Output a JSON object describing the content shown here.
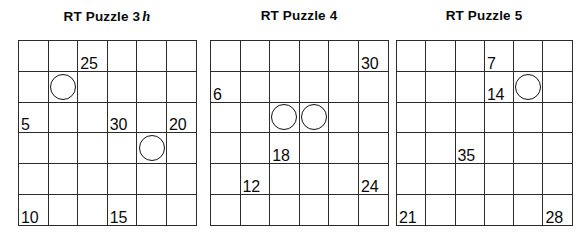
{
  "sheet": {
    "background_color": "#ffffff",
    "grid_line_color": "#2b2b2b",
    "text_color": "#0a0a0a"
  },
  "puzzles": [
    {
      "id": "puzzle-3",
      "title_main": "RT Puzzle 3",
      "title_hint": "h",
      "left": 18,
      "width": 178,
      "rows": 6,
      "cols": 6,
      "cell_w": 29.6,
      "cell_h": 30.8,
      "cells": [
        [
          {
            "value": "",
            "circle": false
          },
          {
            "value": "",
            "circle": false
          },
          {
            "value": "25",
            "circle": false
          },
          {
            "value": "",
            "circle": false
          },
          {
            "value": "",
            "circle": false
          },
          {
            "value": "",
            "circle": false
          }
        ],
        [
          {
            "value": "",
            "circle": false
          },
          {
            "value": "",
            "circle": true
          },
          {
            "value": "",
            "circle": false
          },
          {
            "value": "",
            "circle": false
          },
          {
            "value": "",
            "circle": false
          },
          {
            "value": "",
            "circle": false
          }
        ],
        [
          {
            "value": "5",
            "circle": false
          },
          {
            "value": "",
            "circle": false
          },
          {
            "value": "",
            "circle": false
          },
          {
            "value": "30",
            "circle": false
          },
          {
            "value": "",
            "circle": false
          },
          {
            "value": "20",
            "circle": false
          }
        ],
        [
          {
            "value": "",
            "circle": false
          },
          {
            "value": "",
            "circle": false
          },
          {
            "value": "",
            "circle": false
          },
          {
            "value": "",
            "circle": false
          },
          {
            "value": "",
            "circle": true
          },
          {
            "value": "",
            "circle": false
          }
        ],
        [
          {
            "value": "",
            "circle": false
          },
          {
            "value": "",
            "circle": false
          },
          {
            "value": "",
            "circle": false
          },
          {
            "value": "",
            "circle": false
          },
          {
            "value": "",
            "circle": false
          },
          {
            "value": "",
            "circle": false
          }
        ],
        [
          {
            "value": "10",
            "circle": false
          },
          {
            "value": "",
            "circle": false
          },
          {
            "value": "",
            "circle": false
          },
          {
            "value": "15",
            "circle": false
          },
          {
            "value": "",
            "circle": false
          },
          {
            "value": "",
            "circle": false
          }
        ]
      ]
    },
    {
      "id": "puzzle-4",
      "title_main": "RT Puzzle 4",
      "title_hint": "",
      "left": 210,
      "width": 178,
      "rows": 6,
      "cols": 6,
      "cell_w": 29.6,
      "cell_h": 30.8,
      "cells": [
        [
          {
            "value": "",
            "circle": false
          },
          {
            "value": "",
            "circle": false
          },
          {
            "value": "",
            "circle": false
          },
          {
            "value": "",
            "circle": false
          },
          {
            "value": "",
            "circle": false
          },
          {
            "value": "30",
            "circle": false
          }
        ],
        [
          {
            "value": "6",
            "circle": false
          },
          {
            "value": "",
            "circle": false
          },
          {
            "value": "",
            "circle": false
          },
          {
            "value": "",
            "circle": false
          },
          {
            "value": "",
            "circle": false
          },
          {
            "value": "",
            "circle": false
          }
        ],
        [
          {
            "value": "",
            "circle": false
          },
          {
            "value": "",
            "circle": false
          },
          {
            "value": "",
            "circle": true
          },
          {
            "value": "",
            "circle": true
          },
          {
            "value": "",
            "circle": false
          },
          {
            "value": "",
            "circle": false
          }
        ],
        [
          {
            "value": "",
            "circle": false
          },
          {
            "value": "",
            "circle": false
          },
          {
            "value": "18",
            "circle": false
          },
          {
            "value": "",
            "circle": false
          },
          {
            "value": "",
            "circle": false
          },
          {
            "value": "",
            "circle": false
          }
        ],
        [
          {
            "value": "",
            "circle": false
          },
          {
            "value": "12",
            "circle": false
          },
          {
            "value": "",
            "circle": false
          },
          {
            "value": "",
            "circle": false
          },
          {
            "value": "",
            "circle": false
          },
          {
            "value": "24",
            "circle": false
          }
        ],
        [
          {
            "value": "",
            "circle": false
          },
          {
            "value": "",
            "circle": false
          },
          {
            "value": "",
            "circle": false
          },
          {
            "value": "",
            "circle": false
          },
          {
            "value": "",
            "circle": false
          },
          {
            "value": "",
            "circle": false
          }
        ]
      ]
    },
    {
      "id": "puzzle-5",
      "title_main": "RT Puzzle 5",
      "title_hint": "",
      "left": 396,
      "width": 176,
      "rows": 6,
      "cols": 6,
      "cell_w": 29.3,
      "cell_h": 30.8,
      "cells": [
        [
          {
            "value": "",
            "circle": false
          },
          {
            "value": "",
            "circle": false
          },
          {
            "value": "",
            "circle": false
          },
          {
            "value": "7",
            "circle": false
          },
          {
            "value": "",
            "circle": false
          },
          {
            "value": "",
            "circle": false
          }
        ],
        [
          {
            "value": "",
            "circle": false
          },
          {
            "value": "",
            "circle": false
          },
          {
            "value": "",
            "circle": false
          },
          {
            "value": "14",
            "circle": false
          },
          {
            "value": "",
            "circle": true
          },
          {
            "value": "",
            "circle": false
          }
        ],
        [
          {
            "value": "",
            "circle": false
          },
          {
            "value": "",
            "circle": false
          },
          {
            "value": "",
            "circle": false
          },
          {
            "value": "",
            "circle": false
          },
          {
            "value": "",
            "circle": false
          },
          {
            "value": "",
            "circle": false
          }
        ],
        [
          {
            "value": "",
            "circle": false
          },
          {
            "value": "",
            "circle": false
          },
          {
            "value": "35",
            "circle": false
          },
          {
            "value": "",
            "circle": false
          },
          {
            "value": "",
            "circle": false
          },
          {
            "value": "",
            "circle": false
          }
        ],
        [
          {
            "value": "",
            "circle": false
          },
          {
            "value": "",
            "circle": false
          },
          {
            "value": "",
            "circle": false
          },
          {
            "value": "",
            "circle": false
          },
          {
            "value": "",
            "circle": false
          },
          {
            "value": "",
            "circle": false
          }
        ],
        [
          {
            "value": "21",
            "circle": false
          },
          {
            "value": "",
            "circle": false
          },
          {
            "value": "",
            "circle": false
          },
          {
            "value": "",
            "circle": false
          },
          {
            "value": "",
            "circle": false
          },
          {
            "value": "28",
            "circle": false
          }
        ]
      ]
    }
  ]
}
